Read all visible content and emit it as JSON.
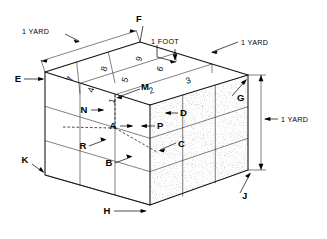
{
  "figure": {
    "colors": {
      "line": "#111111",
      "grid": "#333333",
      "stipple": "#b9b9b9",
      "background": "#ffffff"
    }
  },
  "dimensions": [
    {
      "id": "yard-top-left",
      "label": "1 YARD"
    },
    {
      "id": "foot-top",
      "label": "1 FOOT"
    },
    {
      "id": "yard-top-right",
      "label": "1 YARD"
    },
    {
      "id": "yard-right",
      "label": "1 YARD"
    }
  ],
  "point_labels": [
    {
      "id": "F",
      "label": "F"
    },
    {
      "id": "E",
      "label": "E"
    },
    {
      "id": "G",
      "label": "G"
    },
    {
      "id": "M",
      "label": "M"
    },
    {
      "id": "N",
      "label": "N"
    },
    {
      "id": "A",
      "label": "A"
    },
    {
      "id": "P",
      "label": "P"
    },
    {
      "id": "D",
      "label": "D"
    },
    {
      "id": "R",
      "label": "R"
    },
    {
      "id": "B",
      "label": "B"
    },
    {
      "id": "C",
      "label": "C"
    },
    {
      "id": "K",
      "label": "K"
    },
    {
      "id": "J",
      "label": "J"
    },
    {
      "id": "H",
      "label": "H"
    }
  ],
  "top_face_numbers": [
    {
      "cell": "back-left",
      "label": "7"
    },
    {
      "cell": "back-mid",
      "label": "8"
    },
    {
      "cell": "back-right",
      "label": "9"
    },
    {
      "cell": "mid-left",
      "label": "4"
    },
    {
      "cell": "mid-mid",
      "label": "5"
    },
    {
      "cell": "mid-right",
      "label": "6"
    },
    {
      "cell": "front-left",
      "label": "1"
    },
    {
      "cell": "front-mid",
      "label": "2"
    },
    {
      "cell": "front-right",
      "label": "3"
    }
  ]
}
